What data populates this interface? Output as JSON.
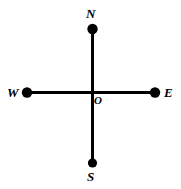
{
  "diagram": {
    "background_color": "#ffffff",
    "stroke_color": "#000000",
    "canvas": {
      "width": 181,
      "height": 189
    },
    "origin": {
      "x": 92.5,
      "y": 92.5
    },
    "axes": [
      {
        "name": "vertical-axis",
        "orientation": "vertical",
        "x1": 92.5,
        "y1": 29,
        "x2": 92.5,
        "y2": 163,
        "stroke_width": 2.2
      },
      {
        "name": "horizontal-axis",
        "orientation": "horizontal",
        "x1": 27,
        "y1": 92.5,
        "x2": 155,
        "y2": 92.5,
        "stroke_width": 2.2
      }
    ],
    "points": [
      {
        "id": "north",
        "label": "N",
        "cx": 92.5,
        "cy": 29,
        "r": 5.2,
        "fill": "#000000"
      },
      {
        "id": "south",
        "label": "S",
        "cx": 92.5,
        "cy": 163,
        "r": 4.6,
        "fill": "#000000"
      },
      {
        "id": "west",
        "label": "W",
        "cx": 27,
        "cy": 92.5,
        "r": 5.2,
        "fill": "#000000"
      },
      {
        "id": "east",
        "label": "E",
        "cx": 155,
        "cy": 92.5,
        "r": 5.2,
        "fill": "#000000"
      }
    ],
    "labels": {
      "north": "N",
      "south": "S",
      "west": "W",
      "east": "E",
      "origin": "O"
    }
  }
}
